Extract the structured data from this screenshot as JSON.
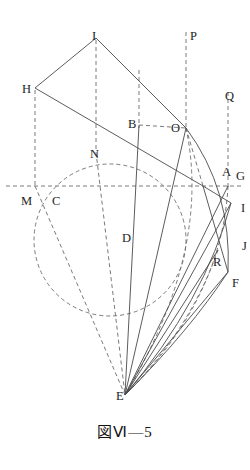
{
  "figure": {
    "caption": "図Ⅵ—5",
    "width": 250,
    "height": 470,
    "background_color": "#ffffff",
    "stroke_color": "#4a4a4a",
    "dashed_color": "#6b6b6b",
    "label_color": "#1e1e1e"
  },
  "labels": [
    {
      "id": "I-top",
      "text": "I",
      "x": 92,
      "y": 30,
      "name": "point-label-i-top"
    },
    {
      "id": "P",
      "text": "P",
      "x": 190,
      "y": 30,
      "name": "point-label-p"
    },
    {
      "id": "H",
      "text": "H",
      "x": 22,
      "y": 83,
      "name": "point-label-h"
    },
    {
      "id": "Q",
      "text": "Q",
      "x": 225,
      "y": 90,
      "name": "point-label-q"
    },
    {
      "id": "B",
      "text": "B",
      "x": 128,
      "y": 118,
      "name": "point-label-b"
    },
    {
      "id": "O",
      "text": "O",
      "x": 171,
      "y": 122,
      "name": "point-label-o"
    },
    {
      "id": "N",
      "text": "N",
      "x": 90,
      "y": 148,
      "name": "point-label-n"
    },
    {
      "id": "A",
      "text": "A",
      "x": 222,
      "y": 166,
      "name": "point-label-a"
    },
    {
      "id": "G",
      "text": "G",
      "x": 236,
      "y": 170,
      "name": "point-label-g"
    },
    {
      "id": "M",
      "text": "M",
      "x": 21,
      "y": 195,
      "name": "point-label-m"
    },
    {
      "id": "C",
      "text": "C",
      "x": 52,
      "y": 195,
      "name": "point-label-c"
    },
    {
      "id": "I-right",
      "text": "I",
      "x": 241,
      "y": 202,
      "name": "point-label-i-right"
    },
    {
      "id": "D",
      "text": "D",
      "x": 122,
      "y": 232,
      "name": "point-label-d"
    },
    {
      "id": "J",
      "text": "J",
      "x": 242,
      "y": 240,
      "name": "point-label-j-right"
    },
    {
      "id": "R",
      "text": "R",
      "x": 213,
      "y": 256,
      "name": "point-label-r"
    },
    {
      "id": "F",
      "text": "F",
      "x": 232,
      "y": 277,
      "name": "point-label-f"
    },
    {
      "id": "E",
      "text": "E",
      "x": 116,
      "y": 390,
      "name": "point-label-e"
    }
  ],
  "geometry": {
    "solid_lines": [
      {
        "name": "segment-h-i",
        "x1": 35,
        "y1": 88,
        "x2": 96,
        "y2": 38
      },
      {
        "name": "segment-i-o",
        "x1": 96,
        "y1": 38,
        "x2": 186,
        "y2": 128
      },
      {
        "name": "segment-h-a",
        "x1": 35,
        "y1": 88,
        "x2": 203,
        "y2": 186
      },
      {
        "name": "segment-o-e",
        "x1": 186,
        "y1": 128,
        "x2": 125,
        "y2": 395
      },
      {
        "name": "segment-b-d-e",
        "x1": 139,
        "y1": 125,
        "x2": 125,
        "y2": 395
      },
      {
        "name": "segment-e-i",
        "x1": 125,
        "y1": 395,
        "x2": 231,
        "y2": 203
      },
      {
        "name": "segment-e-r",
        "x1": 125,
        "y1": 395,
        "x2": 218,
        "y2": 250
      },
      {
        "name": "segment-e-f",
        "x1": 125,
        "y1": 395,
        "x2": 228,
        "y2": 272
      },
      {
        "name": "segment-e-g",
        "x1": 125,
        "y1": 395,
        "x2": 228,
        "y2": 186
      },
      {
        "name": "segment-a-i",
        "x1": 203,
        "y1": 186,
        "x2": 231,
        "y2": 203
      },
      {
        "name": "segment-a-f",
        "x1": 203,
        "y1": 186,
        "x2": 228,
        "y2": 272
      }
    ],
    "dashed_lines": [
      {
        "name": "vertical-line-i-top",
        "x1": 96,
        "y1": 40,
        "x2": 96,
        "y2": 152
      },
      {
        "name": "vertical-line-h-m",
        "x1": 35,
        "y1": 90,
        "x2": 35,
        "y2": 188
      },
      {
        "name": "vertical-line-b",
        "x1": 139,
        "y1": 70,
        "x2": 139,
        "y2": 128
      },
      {
        "name": "vertical-line-p",
        "x1": 186,
        "y1": 32,
        "x2": 186,
        "y2": 130
      },
      {
        "name": "vertical-line-q",
        "x1": 228,
        "y1": 92,
        "x2": 228,
        "y2": 188
      },
      {
        "name": "horizontal-axis-mag",
        "x1": 6,
        "y1": 186,
        "x2": 244,
        "y2": 186
      },
      {
        "name": "chord-b-o",
        "x1": 139,
        "y1": 125,
        "x2": 186,
        "y2": 128
      },
      {
        "name": "chord-o-a",
        "x1": 186,
        "y1": 128,
        "x2": 203,
        "y2": 186
      },
      {
        "name": "chord-n-e",
        "x1": 96,
        "y1": 152,
        "x2": 125,
        "y2": 395
      },
      {
        "name": "chord-m-e",
        "x1": 35,
        "y1": 186,
        "x2": 125,
        "y2": 395
      }
    ],
    "dashed_circle": {
      "name": "main-dashed-circle",
      "cx": 110,
      "cy": 240,
      "r": 76
    },
    "solid_arcs": [
      {
        "name": "arc-o-to-f",
        "d": "M 186 128 Q 232 190 228 272"
      },
      {
        "name": "arc-i-to-e",
        "d": "M 231 203 Q 205 300 125 395"
      },
      {
        "name": "arc-f-to-e",
        "d": "M 228 272 Q 190 330 125 395"
      }
    ],
    "dashed_arcs": [
      {
        "name": "dashed-arc-o-a-e",
        "d": "M 186 128 Q 212 250 125 395"
      },
      {
        "name": "dashed-arc-g-e",
        "d": "M 228 186 Q 222 300 125 395"
      },
      {
        "name": "dashed-arc-r-e",
        "d": "M 218 250 Q 190 330 125 395"
      }
    ]
  }
}
